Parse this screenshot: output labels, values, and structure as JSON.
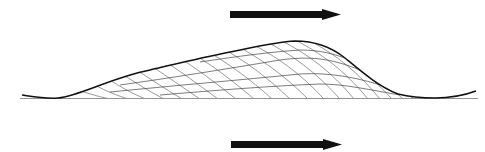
{
  "diagram": {
    "type": "cross-section",
    "colors": {
      "background": "#ffffff",
      "ink": "#111111",
      "laminae": "#555555"
    },
    "arrows": [
      {
        "name": "flow-direction-arrow-top",
        "direction": "right",
        "x1": 230,
        "x2": 341,
        "y": 14
      },
      {
        "name": "flow-direction-arrow-bottom",
        "direction": "right",
        "x1": 231,
        "x2": 342,
        "y": 144
      }
    ],
    "baseline_y": 98,
    "labels": []
  }
}
